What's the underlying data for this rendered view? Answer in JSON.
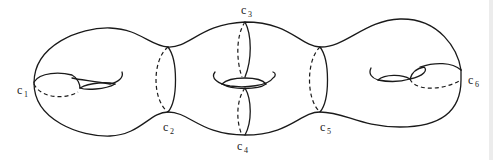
{
  "figure": {
    "labels": [
      {
        "id": "c1",
        "base": "c",
        "sub": "1",
        "x": 17,
        "y": 94
      },
      {
        "id": "c2",
        "base": "c",
        "sub": "2",
        "x": 163,
        "y": 131
      },
      {
        "id": "c3",
        "base": "c",
        "sub": "3",
        "x": 241,
        "y": 14
      },
      {
        "id": "c4",
        "base": "c",
        "sub": "4",
        "x": 237,
        "y": 150
      },
      {
        "id": "c5",
        "base": "c",
        "sub": "5",
        "x": 320,
        "y": 131
      },
      {
        "id": "c6",
        "base": "c",
        "sub": "6",
        "x": 468,
        "y": 84
      }
    ],
    "colors": {
      "stroke": "#1a1a1a",
      "background": "#ffffff"
    }
  }
}
